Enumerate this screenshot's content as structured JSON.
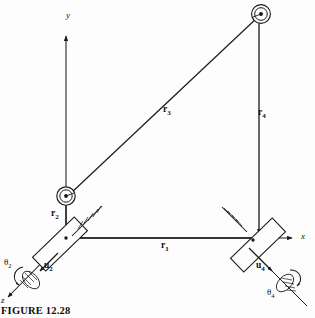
{
  "figure": {
    "caption": "FIGURE 12.28",
    "caption_label": "figure-caption",
    "background_color": "#fdfdfd",
    "line_color": "#1a1a1a"
  },
  "axes": [
    {
      "name": "y-axis",
      "label": "y",
      "direction": "up"
    },
    {
      "name": "x-axis",
      "label": "x",
      "direction": "right"
    },
    {
      "name": "z-axis",
      "label": "z",
      "direction": "lower-left"
    }
  ],
  "vectors": [
    {
      "name": "r1",
      "label": "r",
      "subscript": "1",
      "description": "ground link from left slider to right slider"
    },
    {
      "name": "r2",
      "label": "r",
      "subscript": "2",
      "description": "vertical link from left slider up to left pin joint"
    },
    {
      "name": "r3",
      "label": "r",
      "subscript": "3",
      "description": "coupler from left pin joint to upper right pin joint"
    },
    {
      "name": "r4",
      "label": "r",
      "subscript": "4",
      "description": "vertical link from right slider up to upper pin joint"
    }
  ],
  "displacements": [
    {
      "name": "u2",
      "label": "u",
      "subscript": "2",
      "description": "slider displacement at left joint along z"
    },
    {
      "name": "u4",
      "label": "u",
      "subscript": "4",
      "description": "slider displacement at right joint along z"
    }
  ],
  "rotations": [
    {
      "name": "theta2",
      "label": "θ",
      "subscript": "2",
      "description": "rotation about z at left slider"
    },
    {
      "name": "theta4",
      "label": "θ",
      "subscript": "4",
      "description": "rotation about z at right slider"
    }
  ],
  "joints": [
    {
      "name": "pin-joint-left",
      "type": "pin",
      "x": 66,
      "y": 196
    },
    {
      "name": "pin-joint-upper-right",
      "type": "pin",
      "x": 261,
      "y": 14
    },
    {
      "name": "slider-left",
      "type": "slider",
      "x": 66,
      "y": 238
    },
    {
      "name": "slider-right",
      "type": "slider",
      "x": 255,
      "y": 238
    }
  ]
}
